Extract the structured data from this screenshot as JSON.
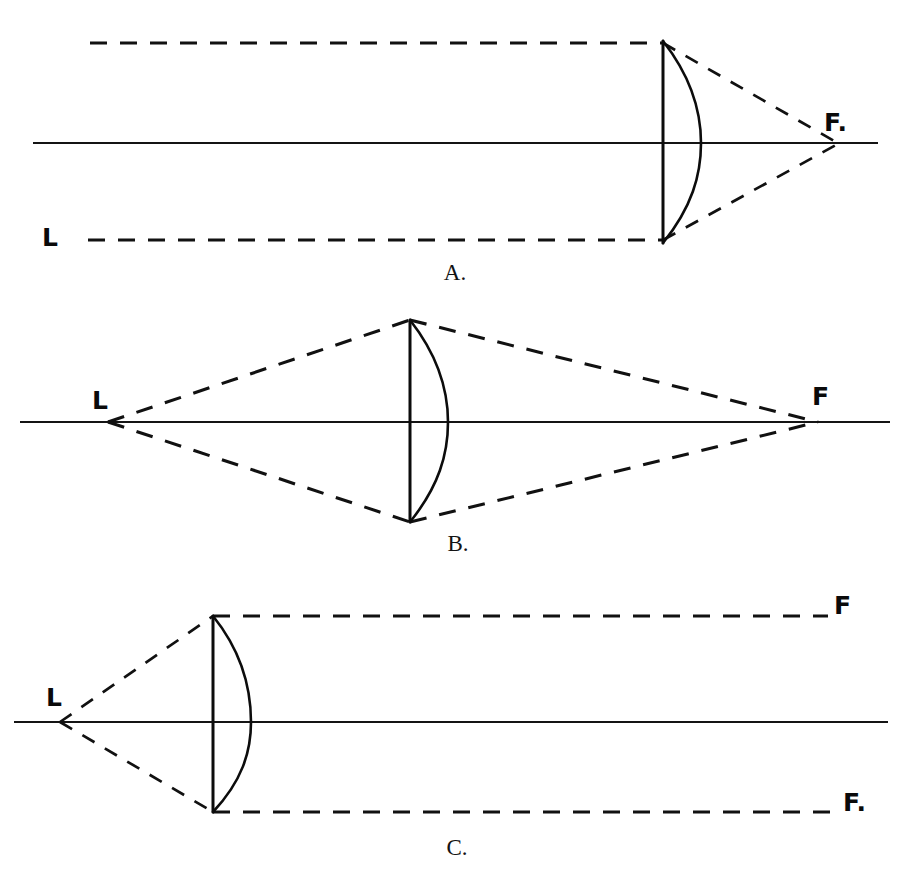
{
  "figure": {
    "title": "Action of a convex lens on light from sources at different distances",
    "background_color": "#ffffff",
    "ink_color": "#111111",
    "width": 912,
    "height": 878
  },
  "panels": [
    {
      "id": "A",
      "caption": "A.",
      "caption_x": 455,
      "caption_y": 280,
      "description": "Parallel rays from a distant source L converge to focus F behind the lens",
      "axis": {
        "x1": 33,
        "y1": 143,
        "x2": 878,
        "y2": 143
      },
      "lens": {
        "flat_x": 663,
        "top_y": 41,
        "bottom_y": 243,
        "bulge_x": 701,
        "center_y": 143
      },
      "labels": [
        {
          "name": "source-label-L",
          "text": "L",
          "x": 42,
          "y": 246,
          "size": "large"
        },
        {
          "name": "focus-label-F",
          "text": "F.",
          "x": 824,
          "y": 131,
          "size": "large"
        }
      ],
      "rays": [
        {
          "name": "incident-ray-top",
          "points": "90,43 663,43"
        },
        {
          "name": "incident-ray-bottom",
          "points": "88,240 663,240"
        },
        {
          "name": "refracted-ray-top",
          "points": "663,43 836,142"
        },
        {
          "name": "refracted-ray-bottom",
          "points": "663,240 836,144"
        }
      ]
    },
    {
      "id": "B",
      "caption": "B.",
      "caption_x": 458,
      "caption_y": 551,
      "description": "Rays from near source L converge to a focus F at a similar distance beyond the lens",
      "axis": {
        "x1": 20,
        "y1": 422,
        "x2": 890,
        "y2": 422
      },
      "lens": {
        "flat_x": 410,
        "top_y": 320,
        "bottom_y": 522,
        "bulge_x": 448,
        "center_y": 422
      },
      "labels": [
        {
          "name": "source-label-L",
          "text": "L",
          "x": 92,
          "y": 409,
          "size": "large"
        },
        {
          "name": "focus-label-F",
          "text": "F",
          "x": 812,
          "y": 405,
          "size": "large"
        }
      ],
      "rays": [
        {
          "name": "incident-ray-upper",
          "points": "108,422 410,320"
        },
        {
          "name": "incident-ray-lower",
          "points": "108,422 410,522"
        },
        {
          "name": "refracted-ray-upper",
          "points": "410,320 818,422"
        },
        {
          "name": "refracted-ray-lower",
          "points": "410,522 818,422"
        }
      ]
    },
    {
      "id": "C",
      "caption": "C.",
      "caption_x": 457,
      "caption_y": 855,
      "description": "Rays from source L at the focal point emerge parallel toward F and F",
      "axis": {
        "x1": 14,
        "y1": 722,
        "x2": 888,
        "y2": 722
      },
      "lens": {
        "flat_x": 213,
        "top_y": 616,
        "bottom_y": 812,
        "bulge_x": 251,
        "center_y": 722
      },
      "labels": [
        {
          "name": "source-label-L",
          "text": "L",
          "x": 46,
          "y": 706,
          "size": "large"
        },
        {
          "name": "focus-label-F-upper",
          "text": "F",
          "x": 834,
          "y": 614,
          "size": "large"
        },
        {
          "name": "focus-label-F-lower",
          "text": "F.",
          "x": 843,
          "y": 811,
          "size": "large"
        }
      ],
      "rays": [
        {
          "name": "incident-ray-upper",
          "points": "60,722 213,616"
        },
        {
          "name": "incident-ray-lower",
          "points": "60,722 213,812"
        },
        {
          "name": "emergent-ray-upper",
          "points": "213,616 828,616"
        },
        {
          "name": "emergent-ray-lower",
          "points": "213,812 838,812"
        }
      ]
    }
  ],
  "legend": {
    "source_point_name": "L",
    "focus_point_name": "F",
    "solid_line_meaning": "optical axis and lens outline",
    "dashed_line_meaning": "light rays"
  }
}
